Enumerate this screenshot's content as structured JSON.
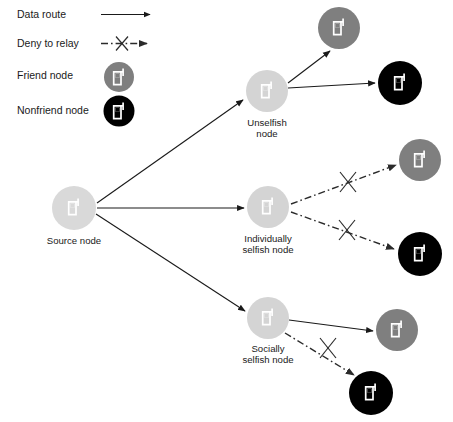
{
  "figure": {
    "type": "network-diagram"
  },
  "colors": {
    "background": "#ffffff",
    "source_node_fill": "#d9d9d9",
    "relay_node_fill": "#d4d4d4",
    "friend_node_fill": "#7f7f7f",
    "nonfriend_node_fill": "#000000",
    "icon_stroke": "#ffffff",
    "line": "#1a1a1a",
    "text": "#1a1a1a"
  },
  "legend": {
    "items": [
      {
        "id": "data-route",
        "label": "Data route",
        "symbol": "solid-arrow"
      },
      {
        "id": "deny-to-relay",
        "label": "Deny to relay",
        "symbol": "dash-dot-arrow-with-x"
      },
      {
        "id": "friend-node",
        "label": "Friend node",
        "symbol": "gray-circle-phone"
      },
      {
        "id": "nonfriend-node",
        "label": "Nonfriend node",
        "symbol": "black-circle-phone"
      }
    ]
  },
  "nodes": [
    {
      "id": "source",
      "label_line1": "Source node",
      "label_line2": "",
      "kind": "source",
      "cx": 74,
      "cy": 208,
      "r": 22
    },
    {
      "id": "unselfish",
      "label_line1": "Unselfish",
      "label_line2": "node",
      "kind": "relay",
      "cx": 267,
      "cy": 91,
      "r": 21
    },
    {
      "id": "individually-selfish",
      "label_line1": "Individually",
      "label_line2": "selfish node",
      "kind": "relay",
      "cx": 268,
      "cy": 207,
      "r": 21
    },
    {
      "id": "socially-selfish",
      "label_line1": "Socially",
      "label_line2": "selfish node",
      "kind": "relay",
      "cx": 268,
      "cy": 318,
      "r": 21
    },
    {
      "id": "friend-top",
      "label_line1": "",
      "label_line2": "",
      "kind": "friend",
      "cx": 339,
      "cy": 28,
      "r": 21
    },
    {
      "id": "nonfriend-top",
      "label_line1": "",
      "label_line2": "",
      "kind": "nonfriend",
      "cx": 400,
      "cy": 83,
      "r": 22
    },
    {
      "id": "friend-middle",
      "label_line1": "",
      "label_line2": "",
      "kind": "friend",
      "cx": 420,
      "cy": 160,
      "r": 21
    },
    {
      "id": "nonfriend-middle",
      "label_line1": "",
      "label_line2": "",
      "kind": "nonfriend",
      "cx": 420,
      "cy": 254,
      "r": 22
    },
    {
      "id": "friend-bottom",
      "label_line1": "",
      "label_line2": "",
      "kind": "friend",
      "cx": 397,
      "cy": 330,
      "r": 21
    },
    {
      "id": "nonfriend-bottom",
      "label_line1": "",
      "label_line2": "",
      "kind": "nonfriend",
      "cx": 371,
      "cy": 393,
      "r": 22
    }
  ],
  "edges": [
    {
      "id": "source-to-unselfish",
      "from": "source",
      "to": "unselfish",
      "style": "data-route",
      "blocked": false
    },
    {
      "id": "source-to-individually-selfish",
      "from": "source",
      "to": "individually-selfish",
      "style": "data-route",
      "blocked": false
    },
    {
      "id": "source-to-socially-selfish",
      "from": "source",
      "to": "socially-selfish",
      "style": "data-route",
      "blocked": false
    },
    {
      "id": "unselfish-to-friend-top",
      "from": "unselfish",
      "to": "friend-top",
      "style": "data-route",
      "blocked": false
    },
    {
      "id": "unselfish-to-nonfriend-top",
      "from": "unselfish",
      "to": "nonfriend-top",
      "style": "data-route",
      "blocked": false
    },
    {
      "id": "individually-selfish-to-friend-middle",
      "from": "individually-selfish",
      "to": "friend-middle",
      "style": "deny-to-relay",
      "blocked": true
    },
    {
      "id": "individually-selfish-to-nonfriend-middle",
      "from": "individually-selfish",
      "to": "nonfriend-middle",
      "style": "deny-to-relay",
      "blocked": true
    },
    {
      "id": "socially-selfish-to-friend-bottom",
      "from": "socially-selfish",
      "to": "friend-bottom",
      "style": "data-route",
      "blocked": false
    },
    {
      "id": "socially-selfish-to-nonfriend-bottom",
      "from": "socially-selfish",
      "to": "nonfriend-bottom",
      "style": "deny-to-relay",
      "blocked": true
    }
  ]
}
